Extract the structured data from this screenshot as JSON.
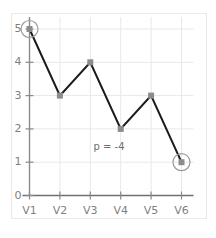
{
  "chart_data": {
    "type": "line",
    "title": "",
    "xlabel": "",
    "ylabel": "",
    "categories": [
      "V1",
      "V2",
      "V3",
      "V4",
      "V5",
      "V6"
    ],
    "values": [
      5,
      3,
      4,
      2,
      3,
      1
    ],
    "series": [
      {
        "name": "series-1",
        "values": [
          5,
          3,
          4,
          2,
          3,
          1
        ]
      }
    ],
    "ylim": [
      0,
      5
    ],
    "yticks": [
      "0",
      "1",
      "2",
      "3",
      "4",
      "5"
    ],
    "ytick_values": [
      0,
      1,
      2,
      3,
      4,
      5
    ],
    "xticks": [
      "V1",
      "V2",
      "V3",
      "V4",
      "V5",
      "V6"
    ],
    "grid": true,
    "legend": false,
    "legend_position": "none",
    "annotations": [
      {
        "text": "p = -4",
        "x": 3.0,
        "y": 1.45
      }
    ],
    "highlighted_points": [
      {
        "category": "V1",
        "value": 5,
        "style": "circle-outline"
      },
      {
        "category": "V6",
        "value": 1,
        "style": "circle-outline"
      }
    ],
    "colors": {
      "line": "#1a1a1a",
      "marker": "#8c8c8c",
      "grid": "#e8e8e8",
      "axis": "#8a8a8a",
      "tick_text": "#7f7f7f",
      "annotation_text": "#6e6e6e",
      "highlight_ring": "#9a9a9a",
      "figure_border": "#e9e9e9",
      "background": "#ffffff"
    }
  }
}
